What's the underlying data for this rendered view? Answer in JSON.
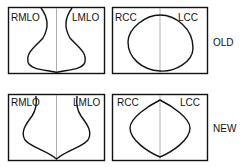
{
  "rows": [
    {
      "label": "OLD",
      "mlo": {
        "left_label": "RMLO",
        "right_label": "LMLO"
      },
      "cc": {
        "left_label": "RCC",
        "right_label": "LCC"
      }
    },
    {
      "label": "NEW",
      "mlo": {
        "left_label": "RMLO",
        "right_label": "LMLO"
      },
      "cc": {
        "left_label": "RCC",
        "right_label": "LCC"
      }
    }
  ],
  "colors": {
    "outline": "#111111",
    "divider": "#999999",
    "background": "#ffffff"
  }
}
